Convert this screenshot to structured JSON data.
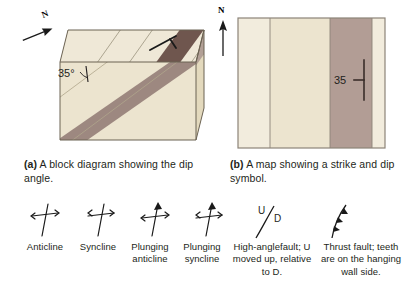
{
  "figure": {
    "panels": [
      {
        "id": "a",
        "tag": "(a)",
        "caption": "A block diagram showing the dip angle.",
        "compass_label": "N",
        "dip_angle_label": "35°",
        "colors": {
          "bed_light": "#ece4cf",
          "bed_light_side": "#e3d9bd",
          "bed_light_top": "#efe8d7",
          "bed_dark": "#9d8880",
          "bed_dark_top": "#6f564e",
          "bed_dark_side": "#b2a096",
          "outline": "#6b6252"
        }
      },
      {
        "id": "b",
        "tag": "(b)",
        "caption": "A map showing a strike and dip symbol.",
        "compass_label": "N",
        "dip_value_label": "35",
        "colors": {
          "unit_light": "#ece4cf",
          "unit_pale": "#f2ecdd",
          "unit_dark": "#b29d95",
          "outline": "#8c8478"
        }
      }
    ],
    "legend": {
      "symbols": [
        {
          "name": "anticline-symbol",
          "label": "Anticline"
        },
        {
          "name": "syncline-symbol",
          "label": "Syncline"
        },
        {
          "name": "plunging-anticline-symbol",
          "label": "Plunging anticline"
        },
        {
          "name": "plunging-syncline-symbol",
          "label": "Plunging syncline"
        },
        {
          "name": "high-angle-fault-symbol",
          "label": "High-anglefault; U moved up, relative to D.",
          "up_marker": "U",
          "down_marker": "D"
        },
        {
          "name": "thrust-fault-symbol",
          "label": "Thrust fault; teeth are on the hanging wall side."
        }
      ]
    }
  }
}
